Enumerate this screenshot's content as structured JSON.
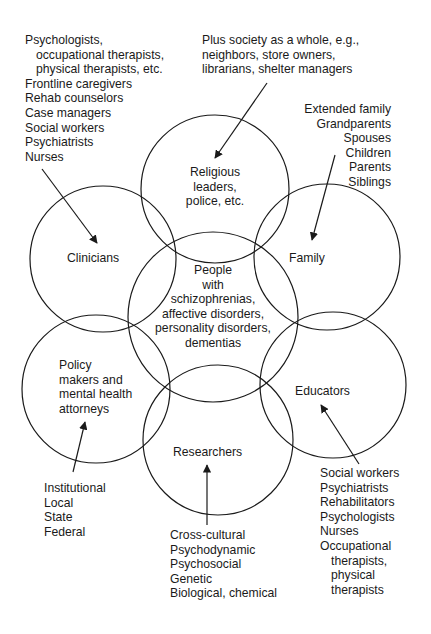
{
  "diagram": {
    "title": "",
    "stroke_color": "#1a1a1a",
    "background": "#ffffff",
    "circles": [
      {
        "id": "religious",
        "label": [
          "Religious",
          "leaders,",
          "police, etc."
        ],
        "cx": 215,
        "cy": 189,
        "r": 74
      },
      {
        "id": "clinicians",
        "label": [
          "Clinicians"
        ],
        "cx": 103,
        "cy": 259,
        "r": 73
      },
      {
        "id": "family",
        "label": [
          "Family"
        ],
        "cx": 327,
        "cy": 257,
        "r": 73
      },
      {
        "id": "people",
        "label": [
          "People",
          "with",
          "schizophrenias,",
          "affective disorders,",
          "personality disorders,",
          "dementias"
        ],
        "cx": 213,
        "cy": 317,
        "r": 85
      },
      {
        "id": "policy",
        "label": [
          "Policy",
          "makers and",
          "mental health",
          "attorneys"
        ],
        "cx": 96,
        "cy": 389,
        "r": 74
      },
      {
        "id": "educators",
        "label": [
          "Educators"
        ],
        "cx": 333,
        "cy": 385,
        "r": 73
      },
      {
        "id": "researchers",
        "label": [
          "Researchers"
        ],
        "cx": 218,
        "cy": 440,
        "r": 75
      }
    ],
    "annotations": {
      "clinicians_list": [
        "Psychologists,",
        "occupational therapists,",
        "physical therapists, etc.",
        "Frontline caregivers",
        "Rehab counselors",
        "Case managers",
        "Social workers",
        "Psychiatrists",
        "Nurses"
      ],
      "society_list": [
        "Plus society as a whole, e.g.,",
        "neighbors, store owners,",
        "librarians, shelter managers"
      ],
      "family_list": [
        "Extended family",
        "Grandparents",
        "Spouses",
        "Children",
        "Parents",
        "Siblings"
      ],
      "policy_list": [
        "Institutional",
        "Local",
        "State",
        "Federal"
      ],
      "researchers_list": [
        "Cross-cultural",
        "Psychodynamic",
        "Psychosocial",
        "Genetic",
        "Biological, chemical"
      ],
      "educators_list": [
        "Social workers",
        "Psychiatrists",
        "Rehabilitators",
        "Psychologists",
        "Nurses",
        "Occupational",
        "therapists,",
        "physical",
        "therapists"
      ]
    },
    "arrows": [
      {
        "from": "clinicians_list",
        "to": "clinicians",
        "x1": 42,
        "y1": 169,
        "x2": 97,
        "y2": 243
      },
      {
        "from": "society_list",
        "to": "religious",
        "x1": 267,
        "y1": 83,
        "x2": 215,
        "y2": 158
      },
      {
        "from": "family_list",
        "to": "family",
        "x1": 335,
        "y1": 155,
        "x2": 312,
        "y2": 240
      },
      {
        "from": "policy_list",
        "to": "policy",
        "x1": 73,
        "y1": 472,
        "x2": 85,
        "y2": 422
      },
      {
        "from": "researchers_list",
        "to": "researchers",
        "x1": 207,
        "y1": 525,
        "x2": 207,
        "y2": 465
      },
      {
        "from": "educators_list",
        "to": "educators",
        "x1": 359,
        "y1": 464,
        "x2": 321,
        "y2": 405
      }
    ]
  }
}
